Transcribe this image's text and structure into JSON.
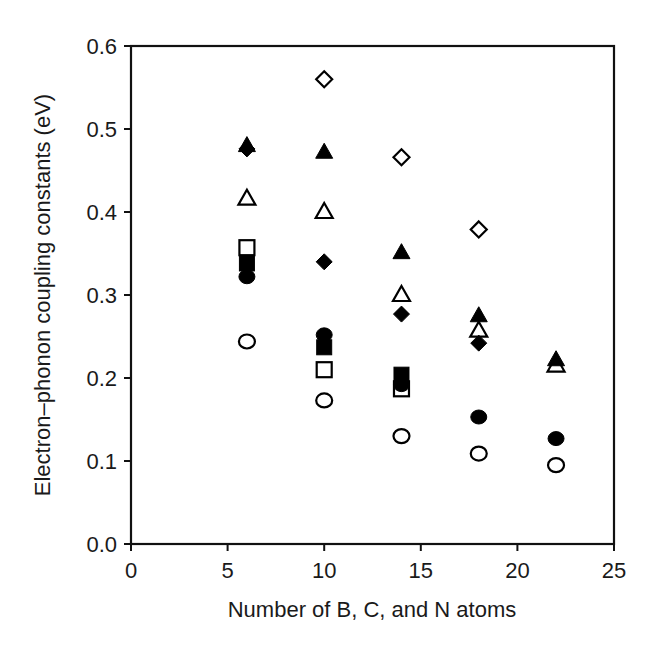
{
  "chart_data": {
    "type": "scatter",
    "title": "",
    "xlabel": "Number of B, C, and N atoms",
    "ylabel": "Electron–phonon coupling constants (eV)",
    "xlim": [
      0,
      25
    ],
    "ylim": [
      0.0,
      0.6
    ],
    "xticks": [
      "0",
      "5",
      "10",
      "15",
      "20",
      "25"
    ],
    "yticks": [
      "0.0",
      "0.1",
      "0.2",
      "0.3",
      "0.4",
      "0.5",
      "0.6"
    ],
    "grid": false,
    "legend": null,
    "series": [
      {
        "name": "open-diamond",
        "marker": "diamond",
        "filled": false,
        "x": [
          10,
          14,
          18
        ],
        "y": [
          0.56,
          0.466,
          0.379
        ]
      },
      {
        "name": "filled-triangle",
        "marker": "triangle",
        "filled": true,
        "x": [
          6,
          10,
          14,
          18,
          22
        ],
        "y": [
          0.48,
          0.472,
          0.351,
          0.275,
          0.222
        ]
      },
      {
        "name": "open-triangle",
        "marker": "triangle",
        "filled": false,
        "x": [
          6,
          10,
          14,
          18,
          22
        ],
        "y": [
          0.416,
          0.4,
          0.3,
          0.257,
          0.215
        ]
      },
      {
        "name": "filled-diamond",
        "marker": "diamond",
        "filled": true,
        "x": [
          6,
          10,
          14,
          18
        ],
        "y": [
          0.476,
          0.34,
          0.277,
          0.242
        ]
      },
      {
        "name": "open-square",
        "marker": "square",
        "filled": false,
        "x": [
          6,
          10,
          14
        ],
        "y": [
          0.357,
          0.21,
          0.187
        ]
      },
      {
        "name": "filled-square",
        "marker": "square",
        "filled": true,
        "x": [
          6,
          10,
          14
        ],
        "y": [
          0.338,
          0.237,
          0.204
        ]
      },
      {
        "name": "filled-circle",
        "marker": "circle",
        "filled": true,
        "x": [
          6,
          10,
          14,
          18,
          22
        ],
        "y": [
          0.322,
          0.252,
          0.192,
          0.153,
          0.127
        ]
      },
      {
        "name": "open-circle",
        "marker": "circle",
        "filled": false,
        "x": [
          6,
          10,
          14,
          18,
          22
        ],
        "y": [
          0.244,
          0.173,
          0.13,
          0.109,
          0.095
        ]
      }
    ]
  },
  "style": {
    "axis_color": "#111111",
    "marker_color": "#000000",
    "background": "#ffffff"
  }
}
